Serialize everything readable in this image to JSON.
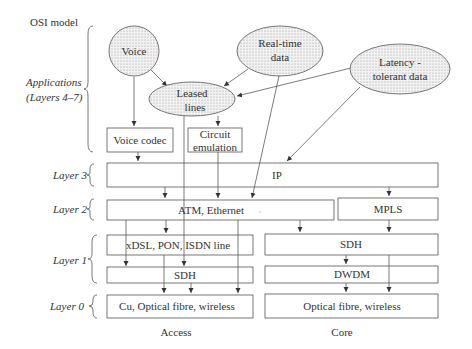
{
  "title": "OSI model",
  "layers": [
    {
      "label": "Applications",
      "sublabel": "(Layers 4–7)"
    },
    {
      "label": "Layer 3"
    },
    {
      "label": "Layer 2"
    },
    {
      "label": "Layer 1"
    },
    {
      "label": "Layer  0"
    }
  ],
  "services": {
    "voice": "Voice",
    "realtime_1": "Real-time",
    "realtime_2": "data",
    "latency_1": "Latency -",
    "latency_2": "tolerant data",
    "leased_1": "Leased",
    "leased_2": "lines"
  },
  "boxes": {
    "voice_codec": "Voice codec",
    "circuit_1": "Circuit",
    "circuit_2": "emulation",
    "ip": "IP",
    "atm": "ATM, Ethernet",
    "mpls": "MPLS",
    "xdsl": "xDSL, PON,  ISDN line",
    "sdh_access": "SDH",
    "sdh_core": "SDH",
    "dwdm": "DWDM",
    "cu": "Cu, Optical fibre, wireless",
    "optical": "Optical fibre, wireless"
  },
  "columns": {
    "access": "Access",
    "core": "Core"
  },
  "colors": {
    "line": "#444444",
    "node_fill": "#e8e8e8"
  }
}
